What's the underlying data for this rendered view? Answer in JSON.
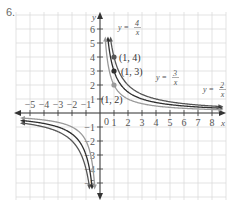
{
  "problem": {
    "number": "6."
  },
  "chart_data": {
    "type": "line",
    "title": "",
    "xlabel": "x",
    "ylabel": "y",
    "xlim": [
      -5.5,
      8.5
    ],
    "ylim": [
      -6,
      6.5
    ],
    "grid": true,
    "x_ticks": [
      -5,
      -4,
      -3,
      -2,
      -1,
      1,
      2,
      3,
      4,
      5,
      6,
      7,
      8
    ],
    "x_tick_labels": [
      "−5",
      "−4",
      "−3",
      "−2",
      "−1",
      "1",
      "2",
      "3",
      "4",
      "5",
      "6",
      "7",
      "8"
    ],
    "y_ticks": [
      6,
      5,
      4,
      3,
      2,
      1,
      -1,
      -2,
      -3,
      -4,
      -5
    ],
    "y_tick_labels": [
      "6",
      "5",
      "4",
      "3",
      "2",
      "1",
      "−1",
      "−2",
      "−3",
      "−4",
      "−5"
    ],
    "origin_label": "0",
    "series": [
      {
        "name": "y = 4/x",
        "k": 4,
        "color": "#555555",
        "label_num": "4",
        "label_den": "x",
        "label_prefix": "y ="
      },
      {
        "name": "y = 3/x",
        "k": 3,
        "color": "#2e2e2e",
        "label_num": "3",
        "label_den": "x",
        "label_prefix": "y ="
      },
      {
        "name": "y = 2/x",
        "k": 2,
        "color": "#9a9a9a",
        "label_num": "2",
        "label_den": "x",
        "label_prefix": "y ="
      }
    ],
    "points": [
      {
        "x": 1,
        "y": 4,
        "label": "(1, 4)",
        "color": "#555555"
      },
      {
        "x": 1,
        "y": 3,
        "label": "(1, 3)",
        "color": "#2e2e2e"
      },
      {
        "x": 1,
        "y": 2,
        "label": "(1, 2)",
        "color": "#9a9a9a"
      }
    ]
  }
}
